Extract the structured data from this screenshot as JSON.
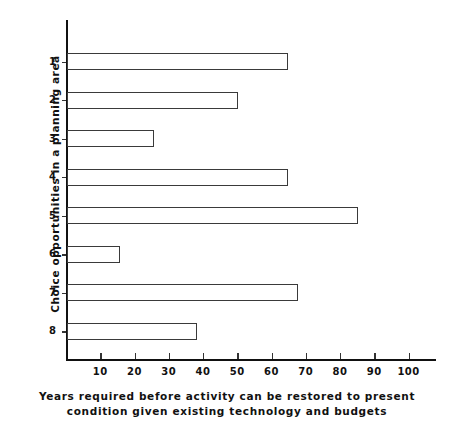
{
  "chart_data": {
    "type": "bar",
    "orientation": "horizontal",
    "title": "",
    "subtitle": "",
    "xlabel": "Years required before activity can be restored to present condition given existing technology and budgets",
    "ylabel": "Choice opportunities in a planning area",
    "categories": [
      "1",
      "2",
      "3",
      "4",
      "5",
      "6",
      "7",
      "8"
    ],
    "values": [
      64.5,
      50,
      25.5,
      64.5,
      85,
      15.5,
      67.5,
      38
    ],
    "xlim": [
      0,
      108
    ],
    "ylim_categories": 8,
    "xticks": [
      10,
      20,
      30,
      40,
      50,
      60,
      70,
      80,
      90,
      100
    ],
    "xtick_labels": [
      "10",
      "20",
      "30",
      "40",
      "50",
      "60",
      "70",
      "80",
      "90",
      "100"
    ],
    "grid": false,
    "legend": false,
    "bar_fill": "#ffffff",
    "bar_edge": "#3a3a3a",
    "axis_color": "#111111"
  },
  "axes": {
    "ylabel_text": "Choice opportunities  in  a  planning  area"
  },
  "caption": {
    "line1": "Years required before activity can be restored to present",
    "line2": "condition given existing technology and budgets"
  }
}
